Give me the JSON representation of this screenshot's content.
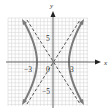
{
  "figure": {
    "type": "hyperbola-graph",
    "axes": {
      "x_label": "x",
      "y_label": "y",
      "tick_labels": {
        "x_neg": "−3",
        "origin": "0",
        "x_pos": "3",
        "y_pos": "5",
        "y_neg": "−5"
      }
    },
    "curves": {
      "hyperbola": "solid gray branches opening left and right, vertices at x = ±3",
      "asymptotes": "two dashed lines through origin"
    },
    "colors": {
      "grid": "#d4d4d4",
      "axis": "#555555",
      "curve": "#777777",
      "asymptote": "#444444"
    }
  }
}
